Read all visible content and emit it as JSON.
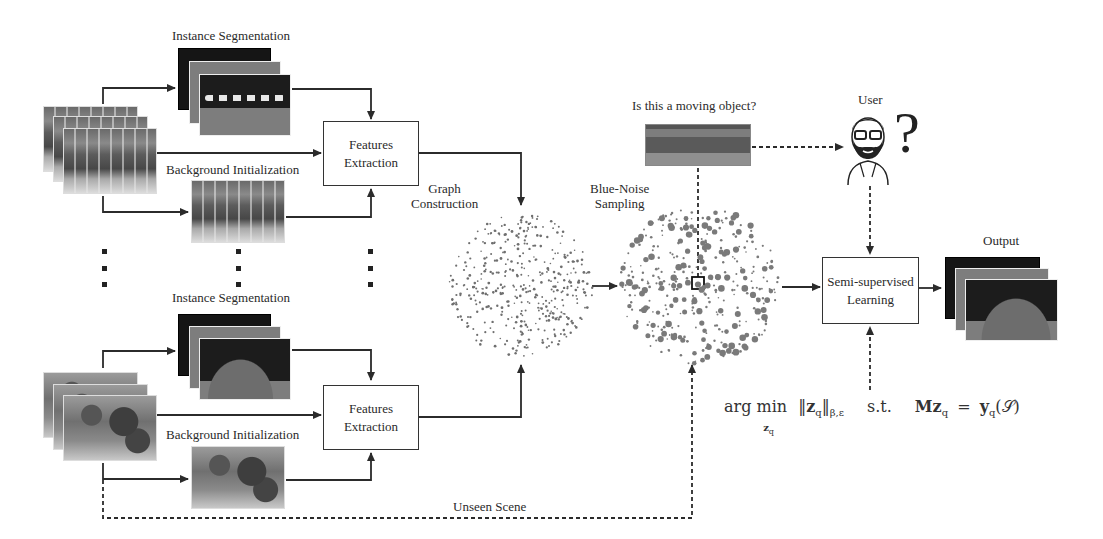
{
  "figure": {
    "top_row": {
      "instance_segmentation_label": "Instance Segmentation",
      "background_initialization_label": "Background Initialization",
      "features_box": {
        "line1": "Features",
        "line2": "Extraction"
      }
    },
    "bottom_row": {
      "instance_segmentation_label": "Instance Segmentation",
      "background_initialization_label": "Background Initialization",
      "features_box": {
        "line1": "Features",
        "line2": "Extraction"
      }
    },
    "graph_construction_label": {
      "line1": "Graph",
      "line2": "Construction"
    },
    "blue_noise_label": {
      "line1": "Blue-Noise",
      "line2": "Sampling"
    },
    "question_label": "Is this a moving object?",
    "user_label": "User",
    "question_mark": "?",
    "ssl_box": {
      "line1": "Semi-supervised",
      "line2": "Learning"
    },
    "output_label": "Output",
    "unseen_scene_label": "Unseen Scene",
    "equation": {
      "argmin": "arg min",
      "sub": "z",
      "sub_q": "q",
      "norm_z": "z",
      "norm_q": "q",
      "norm_sub": "β,ε",
      "st": "s.t.",
      "lhs": "Mz",
      "lhs_q": "q",
      "eq": "=",
      "rhs": "y",
      "rhs_q": "q",
      "rhs_arg": "(𝒮)"
    },
    "ellipsis_columns": 3
  },
  "colors": {
    "line": "#2b2b2b",
    "seg_dark": "#151515",
    "seg_gray": "#7d7d7d",
    "dot_gray": "#777777"
  }
}
